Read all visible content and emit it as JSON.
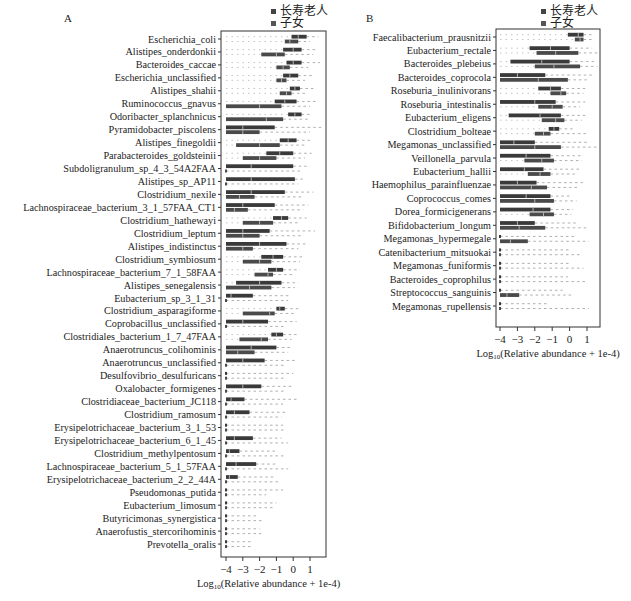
{
  "figure": {
    "legend": [
      {
        "label": "长寿老人",
        "color": "#444444"
      },
      {
        "label": "子女",
        "color": "#555555"
      }
    ]
  },
  "chart_data": [
    {
      "type": "box",
      "panel": "A",
      "orientation": "horizontal",
      "xlabel": "Log10(Relative abundance + 1e-4)",
      "xlabel_base": "Log",
      "xlabel_sub": "10",
      "xlabel_rest": "(Relative abundance + 1e-4)",
      "xlim": [
        -4.2,
        1.9
      ],
      "xticks": [
        -4,
        -3,
        -2,
        -1,
        0,
        1
      ],
      "xtick_labels": [
        "−4",
        "−3",
        "−2",
        "−1",
        "0",
        "1"
      ],
      "legend_position": "top-right",
      "series_names": [
        "长寿老人",
        "子女"
      ],
      "categories": [
        "Escherichia_coli",
        "Alistipes_onderdonkii",
        "Bacteroides_caccae",
        "Escherichia_unclassified",
        "Alistipes_shahii",
        "Ruminococcus_gnavus",
        "Odoribacter_splanchnicus",
        "Pyramidobacter_piscolens",
        "Alistipes_finegoldii",
        "Parabacteroides_goldsteinii",
        "Subdoligranulum_sp_4_3_54A2FAA",
        "Alistipes_sp_AP11",
        "Clostridium_nexile",
        "Lachnospiraceae_bacterium_3_1_57FAA_CT1",
        "Clostridium_hathewayi",
        "Clostridium_leptum",
        "Alistipes_indistinctus",
        "Clostridium_symbiosum",
        "Lachnospiraceae_bacterium_7_1_58FAA",
        "Alistipes_senegalensis",
        "Eubacterium_sp_3_1_31",
        "Clostridium_asparagiforme",
        "Coprobacillus_unclassified",
        "Clostridiales_bacterium_1_7_47FAA",
        "Anaerotruncus_colihominis",
        "Anaerotruncus_unclassified",
        "Desulfovibrio_desulfuricans",
        "Oxalobacter_formigenes",
        "Clostridiaceae_bacterium_JC118",
        "Clostridium_ramosum",
        "Erysipelotrichaceae_bacterium_3_1_53",
        "Erysipelotrichaceae_bacterium_6_1_45",
        "Clostridium_methylpentosum",
        "Lachnospiraceae_bacterium_5_1_57FAA",
        "Erysipelotrichaceae_bacterium_2_2_44A",
        "Pseudomonas_putida",
        "Eubacterium_limosum",
        "Butyricimonas_synergistica",
        "Anaerofustis_stercorihominis",
        "Prevotella_oralis"
      ],
      "series": [
        {
          "name": "长寿老人",
          "boxes": [
            [
              -0.1,
              0.3,
              0.8,
              1.5
            ],
            [
              -0.6,
              0.0,
              0.5,
              1.4
            ],
            [
              -0.4,
              0.0,
              0.5,
              1.6
            ],
            [
              -0.6,
              -0.2,
              0.3,
              1.2
            ],
            [
              -0.2,
              0.1,
              0.4,
              1.2
            ],
            [
              -1.1,
              -0.5,
              0.2,
              1.5
            ],
            [
              -0.3,
              0.1,
              0.5,
              1.1
            ],
            [
              -4,
              -3.0,
              -1.1,
              1.8
            ],
            [
              -0.8,
              -0.3,
              0.2,
              1.0
            ],
            [
              -1.6,
              -0.8,
              0.0,
              1.1
            ],
            [
              -4,
              -2.5,
              0.0,
              1.0
            ],
            [
              -4,
              -2.5,
              0.1,
              0.6
            ],
            [
              -4,
              -2.5,
              -0.5,
              1.2
            ],
            [
              -4,
              -3.0,
              -1.1,
              0.9
            ],
            [
              -1.2,
              -0.7,
              -0.3,
              0.8
            ],
            [
              -4,
              -3.0,
              -1.4,
              1.3
            ],
            [
              -4,
              -2.0,
              -0.4,
              0.9
            ],
            [
              -1.9,
              -1.2,
              -0.6,
              0.6
            ],
            [
              -1.5,
              -1.0,
              -0.6,
              0.4
            ],
            [
              -3.4,
              -2.0,
              -0.7,
              0.3
            ],
            [
              -4,
              -3.7,
              -2.4,
              -0.2
            ],
            [
              -1.0,
              -0.8,
              -0.5,
              0.3
            ],
            [
              -4,
              -3.0,
              -1.5,
              0.2
            ],
            [
              -1.3,
              -1.0,
              -0.6,
              0.2
            ],
            [
              -4,
              -2.5,
              -1.0,
              -0.1
            ],
            [
              -4,
              -3.0,
              -1.7,
              0.1
            ],
            [
              -4,
              -4,
              -4,
              0.0
            ],
            [
              -4,
              -3.0,
              -1.9,
              -0.1
            ],
            [
              -4,
              -3.7,
              -2.9,
              0.3
            ],
            [
              -4,
              -3.5,
              -2.6,
              -0.4
            ],
            [
              -4,
              -4,
              -4,
              -0.6
            ],
            [
              -4,
              -3.5,
              -2.4,
              -0.7
            ],
            [
              -4,
              -3.8,
              -3.2,
              -0.9
            ],
            [
              -4,
              -3.4,
              -2.2,
              -0.9
            ],
            [
              -4,
              -3.8,
              -3.3,
              -1.1
            ],
            [
              -4,
              -4,
              -4,
              -0.6
            ],
            [
              -4,
              -4,
              -4,
              -1.0
            ],
            [
              -4,
              -4,
              -4,
              -2.1
            ],
            [
              -4,
              -4,
              -4,
              -2.0
            ],
            [
              -4,
              -4,
              -4,
              -2.4
            ]
          ]
        },
        {
          "name": "子女",
          "boxes": [
            [
              -0.5,
              -0.2,
              0.3,
              1.0
            ],
            [
              -1.9,
              -1.0,
              -0.5,
              1.2
            ],
            [
              -1.0,
              -0.6,
              -0.2,
              0.9
            ],
            [
              -1.0,
              -0.7,
              -0.4,
              0.7
            ],
            [
              -0.8,
              -0.4,
              -0.1,
              0.8
            ],
            [
              -4,
              -2.0,
              -0.7,
              1.0
            ],
            [
              -4,
              -1.6,
              -0.6,
              1.0
            ],
            [
              -4,
              -3.0,
              -2.0,
              1.0
            ],
            [
              -3.4,
              -2.0,
              -0.8,
              0.8
            ],
            [
              -3.0,
              -2.0,
              -1.0,
              0.7
            ],
            [
              -4,
              -4,
              -4,
              0.5
            ],
            [
              -4,
              -4,
              -4,
              0.3
            ],
            [
              -4,
              -3.2,
              -2.3,
              0.5
            ],
            [
              -4,
              -3.5,
              -2.7,
              0.6
            ],
            [
              -3.0,
              -2.0,
              -1.2,
              0.4
            ],
            [
              -4,
              -3.0,
              -2.0,
              0.6
            ],
            [
              -4,
              -3.0,
              -2.4,
              0.3
            ],
            [
              -3.0,
              -2.0,
              -1.3,
              0.4
            ],
            [
              -2.3,
              -1.5,
              -1.2,
              0.1
            ],
            [
              -4,
              -2.6,
              -1.3,
              0.1
            ],
            [
              -4,
              -4,
              -4,
              -0.3
            ],
            [
              -3.0,
              -1.4,
              -1.1,
              0.2
            ],
            [
              -4,
              -4,
              -4,
              -0.5
            ],
            [
              -3.2,
              -1.9,
              -1.5,
              -0.1
            ],
            [
              -4,
              -3.3,
              -2.3,
              -0.3
            ],
            [
              -4,
              -4,
              -4,
              -0.5
            ],
            [
              -4,
              -4,
              -4,
              -0.4
            ],
            [
              -4,
              -4,
              -4,
              -0.4
            ],
            [
              -4,
              -4,
              -4,
              -0.6
            ],
            [
              -4,
              -4,
              -4,
              -0.7
            ],
            [
              -4,
              -4,
              -4,
              -0.5
            ],
            [
              -4,
              -4,
              -4,
              -0.3
            ],
            [
              -4,
              -4,
              -4,
              -0.4
            ],
            [
              -4,
              -4,
              -4,
              -0.3
            ],
            [
              -4,
              -4,
              -4,
              -0.8
            ],
            [
              -4,
              -4,
              -4,
              -1.6
            ],
            [
              -4,
              -4,
              -4,
              -1.2
            ],
            [
              -4,
              -4,
              -4,
              -1.7
            ],
            [
              -4,
              -4,
              -4,
              -1.9
            ],
            [
              -4,
              -4,
              -4,
              -2.4
            ]
          ]
        }
      ]
    },
    {
      "type": "box",
      "panel": "B",
      "orientation": "horizontal",
      "xlabel": "Log10(Relative abundance + 1e-4)",
      "xlabel_base": "Log",
      "xlabel_sub": "10",
      "xlabel_rest": "(Relative abundance + 1e-4)",
      "xlim": [
        -4.2,
        1.8
      ],
      "xticks": [
        -4,
        -3,
        -2,
        -1,
        0,
        1
      ],
      "xtick_labels": [
        "−4",
        "−3",
        "−2",
        "−1",
        "0",
        "1"
      ],
      "legend_position": "top-right",
      "series_names": [
        "长寿老人",
        "子女"
      ],
      "categories": [
        "Faecalibacterium_prausnitzii",
        "Eubacterium_rectale",
        "Bacteroides_plebeius",
        "Bacteroides_coprocola",
        "Roseburia_inulinivorans",
        "Roseburia_intestinalis",
        "Eubacterium_eligens",
        "Clostridium_bolteae",
        "Megamonas_unclassified",
        "Veillonella_parvula",
        "Eubacterium_hallii",
        "Haemophilus_parainfluenzae",
        "Coprococcus_comes",
        "Dorea_formicigenerans",
        "Bifidobacterium_longum",
        "Megamonas_hypermegale",
        "Catenibacterium_mitsuokai",
        "Megamonas_funiformis",
        "Bacteroides_coprophilus",
        "Streptococcus_sanguinis",
        "Megamonas_rupellensis"
      ],
      "series": [
        {
          "name": "长寿老人",
          "boxes": [
            [
              -0.1,
              0.5,
              0.8,
              1.3
            ],
            [
              -2.3,
              -1.1,
              0.0,
              1.3
            ],
            [
              -3.4,
              -1.6,
              0.0,
              1.4
            ],
            [
              -4,
              -3.0,
              -1.4,
              1.3
            ],
            [
              -1.8,
              -1.1,
              -0.5,
              0.9
            ],
            [
              -4,
              -2.0,
              -0.8,
              0.9
            ],
            [
              -3.5,
              -1.7,
              -0.5,
              0.9
            ],
            [
              -1.2,
              -0.9,
              -0.6,
              0.3
            ],
            [
              -4,
              -3.2,
              -2.0,
              1.0
            ],
            [
              -4,
              -2.5,
              -1.1,
              0.8
            ],
            [
              -4,
              -2.6,
              -1.5,
              0.7
            ],
            [
              -4,
              -3.0,
              -1.9,
              0.8
            ],
            [
              -4,
              -2.5,
              -1.1,
              0.1
            ],
            [
              -4,
              -2.1,
              -1.1,
              0.2
            ],
            [
              -4,
              -3.0,
              -2.0,
              0.4
            ],
            [
              -4,
              -4,
              -4,
              0.3
            ],
            [
              -4,
              -4,
              -4,
              0.1
            ],
            [
              -4,
              -4,
              -4,
              0.0
            ],
            [
              -4,
              -4,
              -4,
              -0.1
            ],
            [
              -4,
              -4,
              -4,
              -0.4
            ],
            [
              -4,
              -4,
              -4,
              -1.2
            ]
          ]
        },
        {
          "name": "子女",
          "boxes": [
            [
              0.3,
              0.6,
              0.8,
              1.4
            ],
            [
              -1.9,
              -0.8,
              0.5,
              1.6
            ],
            [
              -2.0,
              -0.9,
              0.6,
              1.6
            ],
            [
              -4,
              -1.8,
              -0.1,
              1.0
            ],
            [
              -1.1,
              -0.5,
              -0.2,
              0.8
            ],
            [
              -1.8,
              -1.0,
              -0.4,
              0.6
            ],
            [
              -1.6,
              -0.8,
              -0.3,
              0.7
            ],
            [
              -2.0,
              -1.5,
              -1.1,
              1.0
            ],
            [
              -4,
              -2.0,
              -0.5,
              1.8
            ],
            [
              -2.6,
              -1.6,
              -0.9,
              0.7
            ],
            [
              -2.4,
              -1.7,
              -1.1,
              0.4
            ],
            [
              -4,
              -2.2,
              -1.3,
              0.5
            ],
            [
              -4,
              -2.0,
              -0.9,
              0.4
            ],
            [
              -2.3,
              -1.5,
              -0.9,
              0.1
            ],
            [
              -4,
              -2.9,
              -1.4,
              1.0
            ],
            [
              -4,
              -3.4,
              -2.4,
              1.1
            ],
            [
              -4,
              -4,
              -4,
              0.7
            ],
            [
              -4,
              -4,
              -4,
              0.8
            ],
            [
              -4,
              -4,
              -4,
              1.0
            ],
            [
              -4,
              -3.6,
              -2.9,
              0.2
            ],
            [
              -4,
              -4,
              -4,
              1.1
            ]
          ]
        }
      ]
    }
  ]
}
